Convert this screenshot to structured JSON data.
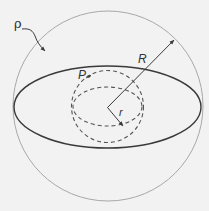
{
  "diagram": {
    "title": "",
    "background": "#f2f2f2",
    "colors": {
      "outer_sphere": "#a8a8a8",
      "equator": "#3a3a3a",
      "dashed": "#555555",
      "arrows": "#3a3a3a",
      "text": "#333333"
    },
    "labels": {
      "density": "ρ",
      "big_radius": "R",
      "point": "P",
      "small_radius": "r"
    },
    "shapes": {
      "outer_sphere": {
        "cx": 108,
        "cy": 106,
        "r": 95
      },
      "equator_ellipse": {
        "cx": 107.5,
        "cy": 107,
        "rx": 93.5,
        "ry": 41
      },
      "inner_sphere": {
        "cx": 107.5,
        "cy": 106.5,
        "r": 36
      },
      "inner_equator": {
        "cx": 107.5,
        "cy": 106.5,
        "rx": 34.5,
        "ry": 19.5
      },
      "center": {
        "x": 107.5,
        "y": 107.5
      },
      "R_arrow_tip": {
        "x": 174,
        "y": 40
      },
      "r_arrow_tip": {
        "x": 123,
        "y": 126
      }
    }
  }
}
